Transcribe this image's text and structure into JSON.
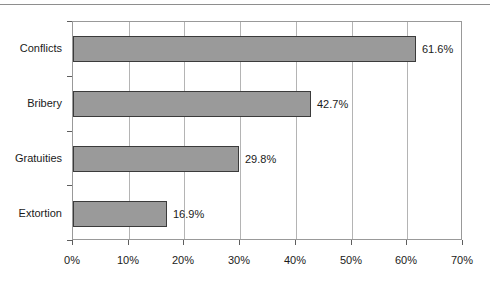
{
  "chart_data": {
    "type": "bar",
    "orientation": "horizontal",
    "title": "",
    "subtitle": "",
    "xlabel": "",
    "ylabel": "",
    "grid": true,
    "legend": false,
    "xlim": [
      0,
      70
    ],
    "xtick_labels": [
      "0%",
      "10%",
      "20%",
      "30%",
      "40%",
      "50%",
      "60%",
      "70%"
    ],
    "xtick_values": [
      0,
      10,
      20,
      30,
      40,
      50,
      60,
      70
    ],
    "categories": [
      "Conflicts",
      "Bribery",
      "Gratuities",
      "Extortion"
    ],
    "values": [
      61.6,
      42.7,
      29.8,
      16.9
    ],
    "data_labels": [
      "61.6%",
      "42.7%",
      "29.8%",
      "16.9%"
    ],
    "bar_color": "#9a9a9a",
    "bar_border_color": "#3b3b3b",
    "gridline_color": "#b4b4b4",
    "axis_color": "#999999"
  }
}
